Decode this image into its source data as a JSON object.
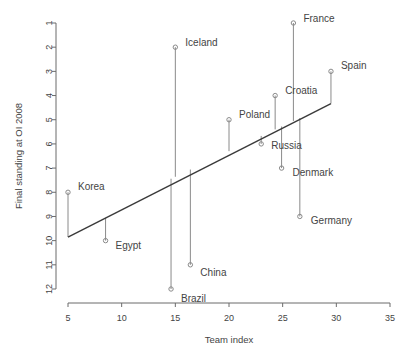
{
  "chart_data": {
    "type": "scatter",
    "title": "",
    "xlabel": "Team index",
    "ylabel": "Final standing at OI 2008",
    "xlim": [
      3.5,
      36.5
    ],
    "ylim": [
      12.6,
      0.4
    ],
    "y_inverted": true,
    "grid": false,
    "legend": "none",
    "xticks": [
      5,
      10,
      15,
      20,
      25,
      30,
      35
    ],
    "yticks": [
      1,
      2,
      3,
      4,
      5,
      6,
      7,
      8,
      9,
      10,
      11,
      12
    ],
    "points": [
      {
        "label": "Korea",
        "x": 5.0,
        "y": 8,
        "label_dx": 10,
        "label_dy": -6
      },
      {
        "label": "Egypt",
        "x": 8.5,
        "y": 10,
        "label_dx": 10,
        "label_dy": 5
      },
      {
        "label": "Iceland",
        "x": 15.0,
        "y": 2,
        "label_dx": 10,
        "label_dy": -5
      },
      {
        "label": "Brazil",
        "x": 14.6,
        "y": 12,
        "label_dx": 10,
        "label_dy": 9
      },
      {
        "label": "China",
        "x": 16.4,
        "y": 11,
        "label_dx": 10,
        "label_dy": 8
      },
      {
        "label": "Poland",
        "x": 20.0,
        "y": 5,
        "label_dx": 10,
        "label_dy": -5
      },
      {
        "label": "Russia",
        "x": 23.0,
        "y": 6,
        "label_dx": 10,
        "label_dy": 2
      },
      {
        "label": "Croatia",
        "x": 24.3,
        "y": 4,
        "label_dx": 10,
        "label_dy": -5
      },
      {
        "label": "Denmark",
        "x": 24.9,
        "y": 7,
        "label_dx": 11,
        "label_dy": 4
      },
      {
        "label": "France",
        "x": 26.0,
        "y": 1,
        "label_dx": 10,
        "label_dy": -5
      },
      {
        "label": "Germany",
        "x": 26.6,
        "y": 9,
        "label_dx": 11,
        "label_dy": 4
      },
      {
        "label": "Spain",
        "x": 29.5,
        "y": 3,
        "label_dx": 10,
        "label_dy": -6
      }
    ],
    "stems": [
      {
        "label": "Korea",
        "x": 5.0,
        "y_from": 8,
        "y_to": 9.85
      },
      {
        "label": "Egypt",
        "x": 8.5,
        "y_from": 10,
        "y_to": 9.06
      },
      {
        "label": "Iceland",
        "x": 15.0,
        "y_from": 2,
        "y_to": 7.36
      },
      {
        "label": "Brazil",
        "x": 14.6,
        "y_from": 12,
        "y_to": 7.44
      },
      {
        "label": "China",
        "x": 16.4,
        "y_from": 11,
        "y_to": 7.06
      },
      {
        "label": "Poland",
        "x": 20.0,
        "y_from": 5,
        "y_to": 6.3
      },
      {
        "label": "Russia",
        "x": 23.0,
        "y_from": 6,
        "y_to": 5.67
      },
      {
        "label": "Croatia",
        "x": 24.3,
        "y_from": 4,
        "y_to": 5.4
      },
      {
        "label": "Denmark",
        "x": 24.9,
        "y_from": 7,
        "y_to": 5.28
      },
      {
        "label": "France",
        "x": 26.0,
        "y_from": 1,
        "y_to": 5.05
      },
      {
        "label": "Germany",
        "x": 26.6,
        "y_from": 9,
        "y_to": 4.93
      },
      {
        "label": "Spain",
        "x": 29.5,
        "y_from": 3,
        "y_to": 4.33
      }
    ],
    "fit_line": {
      "x1": 5.0,
      "y1": 9.85,
      "x2": 29.5,
      "y2": 4.33
    }
  }
}
